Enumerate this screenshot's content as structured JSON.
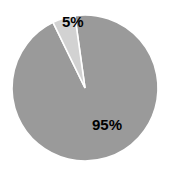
{
  "chart_data": {
    "type": "pie",
    "title": "",
    "categories": [
      "Majority share",
      "Minority share"
    ],
    "values": [
      95,
      5
    ],
    "labels": [
      "95%",
      "5%"
    ],
    "colors": [
      "#9a9a9a",
      "#d2d2d2"
    ],
    "legend": "none",
    "grid": false,
    "start_angle_deg": 98,
    "direction": "clockwise",
    "separator_color": "#ffffff",
    "background": "#ffffff",
    "label_color": "#000000"
  },
  "chart": {
    "background": "#ffffff",
    "center_x": 85,
    "center_y": 88,
    "radius": 73,
    "slices": [
      {
        "name": "minority-slice",
        "label": "5%",
        "value": 5,
        "color": "#d2d2d2"
      },
      {
        "name": "majority-slice",
        "label": "95%",
        "value": 95,
        "color": "#9a9a9a"
      }
    ]
  }
}
